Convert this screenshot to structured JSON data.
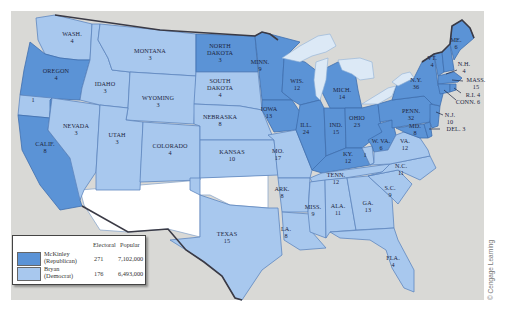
{
  "map": {
    "title": "Election of 1896",
    "colors": {
      "republican": "#5b93d6",
      "democrat": "#a8c8ee",
      "territory": "#ffffff",
      "background": "#d9d9d6",
      "water": "#dce9f6"
    },
    "states": [
      {
        "abbr": "WASH.",
        "ev": "4",
        "party": "D"
      },
      {
        "abbr": "OREGON",
        "ev": "4",
        "party": "R"
      },
      {
        "abbr": "CALIF.",
        "ev": "8",
        "party": "R"
      },
      {
        "abbr": "CALIF. (split)",
        "ev": "1",
        "party": "D"
      },
      {
        "abbr": "IDAHO",
        "ev": "3",
        "party": "D"
      },
      {
        "abbr": "NEVADA",
        "ev": "3",
        "party": "D"
      },
      {
        "abbr": "MONTANA",
        "ev": "3",
        "party": "D"
      },
      {
        "abbr": "WYOMING",
        "ev": "3",
        "party": "D"
      },
      {
        "abbr": "UTAH",
        "ev": "3",
        "party": "D"
      },
      {
        "abbr": "COLORADO",
        "ev": "4",
        "party": "D"
      },
      {
        "abbr": "NORTH DAKOTA",
        "ev": "3",
        "party": "R"
      },
      {
        "abbr": "SOUTH DAKOTA",
        "ev": "4",
        "party": "D"
      },
      {
        "abbr": "NEBRASKA",
        "ev": "8",
        "party": "D"
      },
      {
        "abbr": "KANSAS",
        "ev": "10",
        "party": "D"
      },
      {
        "abbr": "TEXAS",
        "ev": "15",
        "party": "D"
      },
      {
        "abbr": "MINN.",
        "ev": "9",
        "party": "R"
      },
      {
        "abbr": "IOWA",
        "ev": "13",
        "party": "R"
      },
      {
        "abbr": "MO.",
        "ev": "17",
        "party": "D"
      },
      {
        "abbr": "ARK.",
        "ev": "8",
        "party": "D"
      },
      {
        "abbr": "LA.",
        "ev": "8",
        "party": "D"
      },
      {
        "abbr": "WIS.",
        "ev": "12",
        "party": "R"
      },
      {
        "abbr": "ILL.",
        "ev": "24",
        "party": "R"
      },
      {
        "abbr": "MICH.",
        "ev": "14",
        "party": "R"
      },
      {
        "abbr": "IND.",
        "ev": "15",
        "party": "R"
      },
      {
        "abbr": "OHIO",
        "ev": "23",
        "party": "R"
      },
      {
        "abbr": "KY.",
        "ev": "12",
        "party": "R"
      },
      {
        "abbr": "KY. (split)",
        "ev": "1",
        "party": "D"
      },
      {
        "abbr": "TENN.",
        "ev": "12",
        "party": "D"
      },
      {
        "abbr": "MISS.",
        "ev": "9",
        "party": "D"
      },
      {
        "abbr": "ALA.",
        "ev": "11",
        "party": "D"
      },
      {
        "abbr": "GA.",
        "ev": "13",
        "party": "D"
      },
      {
        "abbr": "FLA.",
        "ev": "4",
        "party": "D"
      },
      {
        "abbr": "S.C.",
        "ev": "9",
        "party": "D"
      },
      {
        "abbr": "N.C.",
        "ev": "11",
        "party": "D"
      },
      {
        "abbr": "VA.",
        "ev": "12",
        "party": "D"
      },
      {
        "abbr": "W. VA.",
        "ev": "6",
        "party": "R"
      },
      {
        "abbr": "MD.",
        "ev": "8",
        "party": "R"
      },
      {
        "abbr": "DEL.",
        "ev": "3",
        "party": "R"
      },
      {
        "abbr": "PENN.",
        "ev": "32",
        "party": "R"
      },
      {
        "abbr": "N.J.",
        "ev": "10",
        "party": "R"
      },
      {
        "abbr": "N.Y.",
        "ev": "36",
        "party": "R"
      },
      {
        "abbr": "CONN.",
        "ev": "6",
        "party": "R"
      },
      {
        "abbr": "R.I.",
        "ev": "4",
        "party": "R"
      },
      {
        "abbr": "MASS.",
        "ev": "15",
        "party": "R"
      },
      {
        "abbr": "VT.",
        "ev": "4",
        "party": "R"
      },
      {
        "abbr": "N.H.",
        "ev": "4",
        "party": "R"
      },
      {
        "abbr": "ME.",
        "ev": "6",
        "party": "R"
      }
    ],
    "labels": {
      "wash": "WASH.",
      "wash_ev": "4",
      "oregon": "OREGON",
      "oregon_ev": "4",
      "calif": "CALIF.",
      "calif_ev": "8",
      "calif_split_ev": "1",
      "idaho": "IDAHO",
      "idaho_ev": "3",
      "nevada": "NEVADA",
      "nevada_ev": "3",
      "montana": "MONTANA",
      "montana_ev": "3",
      "wyoming": "WYOMING",
      "wyoming_ev": "3",
      "utah": "UTAH",
      "utah_ev": "3",
      "colorado": "COLORADO",
      "colorado_ev": "4",
      "nd1": "NORTH",
      "nd2": "DAKOTA",
      "nd_ev": "3",
      "sd1": "SOUTH",
      "sd2": "DAKOTA",
      "sd_ev": "4",
      "nebraska": "NEBRASKA",
      "nebraska_ev": "8",
      "kansas": "KANSAS",
      "kansas_ev": "10",
      "texas": "TEXAS",
      "texas_ev": "15",
      "minn": "MINN.",
      "minn_ev": "9",
      "iowa": "IOWA",
      "iowa_ev": "13",
      "mo": "MO.",
      "mo_ev": "17",
      "ark": "ARK.",
      "ark_ev": "8",
      "la": "LA.",
      "la_ev": "8",
      "wis": "WIS.",
      "wis_ev": "12",
      "ill": "ILL.",
      "ill_ev": "24",
      "mich": "MICH.",
      "mich_ev": "14",
      "ind": "IND.",
      "ind_ev": "15",
      "ohio": "OHIO",
      "ohio_ev": "23",
      "ky": "KY.",
      "ky_ev": "12",
      "ky_split_ev": "1",
      "tenn": "TENN.",
      "tenn_ev": "12",
      "miss": "MISS.",
      "miss_ev": "9",
      "ala": "ALA.",
      "ala_ev": "11",
      "ga": "GA.",
      "ga_ev": "13",
      "fla": "FLA.",
      "fla_ev": "4",
      "sc": "S.C.",
      "sc_ev": "9",
      "nc": "N.C.",
      "nc_ev": "11",
      "va": "VA.",
      "va_ev": "12",
      "wva": "W. VA.",
      "wva_ev": "6",
      "md": "MD.",
      "md_ev": "8",
      "del": "DEL. 3",
      "penn": "PENN.",
      "penn_ev": "32",
      "nj": "N.J.",
      "nj_ev": "10",
      "ny": "N.Y.",
      "ny_ev": "36",
      "conn": "CONN. 6",
      "ri": "R.I. 4",
      "mass": "MASS.",
      "mass_ev": "15",
      "vt": "VT.",
      "vt_ev": "4",
      "nh": "N.H.",
      "nh_ev": "4",
      "me": "ME.",
      "me_ev": "6"
    }
  },
  "legend": {
    "col_electoral": "Electoral",
    "col_popular": "Popular",
    "rows": [
      {
        "name": "McKinley",
        "party": "(Republican)",
        "electoral": "271",
        "popular": "7,102,000",
        "color": "#5b93d6"
      },
      {
        "name": "Bryan",
        "party": "(Democrat)",
        "electoral": "176",
        "popular": "6,493,000",
        "color": "#a8c8ee"
      }
    ]
  },
  "credit": "© Cengage Learning"
}
